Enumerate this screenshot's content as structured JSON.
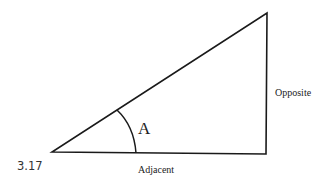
{
  "figure": {
    "number": "3.17",
    "angle_label": "A",
    "side_labels": {
      "opposite": "Opposite",
      "adjacent": "Adjacent"
    },
    "stroke_color": "#1a1a1a"
  }
}
